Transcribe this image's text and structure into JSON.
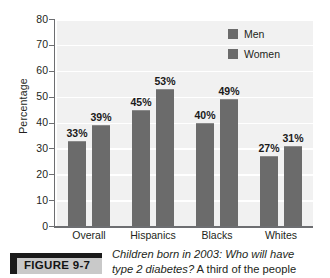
{
  "chart_data": {
    "type": "bar",
    "title": "",
    "xlabel": "",
    "ylabel": "Percentage",
    "ylim": [
      0,
      80
    ],
    "ytick_step": 10,
    "yticks": [
      "80",
      "70",
      "60",
      "50",
      "40",
      "30",
      "20",
      "10",
      "0"
    ],
    "grid": true,
    "legend_position": "top-right",
    "categories": [
      "Overall",
      "Hispanics",
      "Blacks",
      "Whites"
    ],
    "series": [
      {
        "name": "Men",
        "values": [
          33,
          45,
          40,
          27
        ],
        "labels": [
          "33%",
          "45%",
          "40%",
          "27%"
        ],
        "color": "#6b6b6b"
      },
      {
        "name": "Women",
        "values": [
          39,
          53,
          49,
          31
        ],
        "labels": [
          "39%",
          "53%",
          "49%",
          "31%"
        ],
        "color": "#6b6b6b"
      }
    ]
  },
  "legend": {
    "items": [
      {
        "label": "Men",
        "swatch_color": "#6b6b6b"
      },
      {
        "label": "Women",
        "swatch_color": "#6b6b6b"
      }
    ]
  },
  "caption": {
    "figure_tag": "FIGURE 9-7",
    "line1_italic": "Children born in 2003: Who will have",
    "line2_italic": "type 2 diabetes?",
    "line2_roman": " A third of the people"
  },
  "colors": {
    "bar": "#6b6b6b",
    "plot_background": "#f1f1f1",
    "gridline": "#ffffff",
    "axis": "#6d6e71",
    "text": "#231f20",
    "figure_tag_box": "#c9c9c9",
    "figure_tag_accent": "#1a1a1a"
  }
}
